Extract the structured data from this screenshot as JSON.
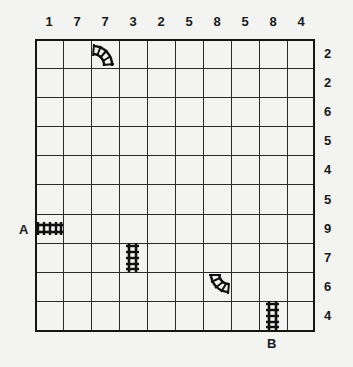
{
  "puzzle": {
    "type": "train-tracks",
    "grid_size": {
      "rows": 10,
      "cols": 10
    },
    "column_clues": [
      "1",
      "7",
      "7",
      "3",
      "2",
      "5",
      "8",
      "5",
      "8",
      "4"
    ],
    "row_clues": [
      "2",
      "2",
      "6",
      "5",
      "4",
      "5",
      "9",
      "7",
      "6",
      "4"
    ],
    "start_label": "A",
    "end_label": "B",
    "given_pieces": [
      {
        "row": 1,
        "col": 3,
        "shape": "curve-left-bottom"
      },
      {
        "row": 7,
        "col": 1,
        "shape": "straight-horizontal"
      },
      {
        "row": 8,
        "col": 4,
        "shape": "straight-vertical"
      },
      {
        "row": 9,
        "col": 7,
        "shape": "curve-top-right"
      },
      {
        "row": 10,
        "col": 9,
        "shape": "straight-vertical"
      }
    ]
  }
}
